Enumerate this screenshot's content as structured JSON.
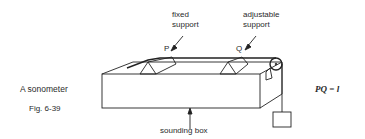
{
  "diagram": {
    "title": "A sonometer",
    "figure_label": "Fig. 6-39",
    "labels": {
      "fixed_support_1": "fixed",
      "fixed_support_2": "support",
      "adjustable_support_1": "adjustable",
      "adjustable_support_2": "support",
      "point_p": "P",
      "point_q": "Q",
      "sounding_box": "sounding box"
    },
    "equation": "PQ = l"
  }
}
